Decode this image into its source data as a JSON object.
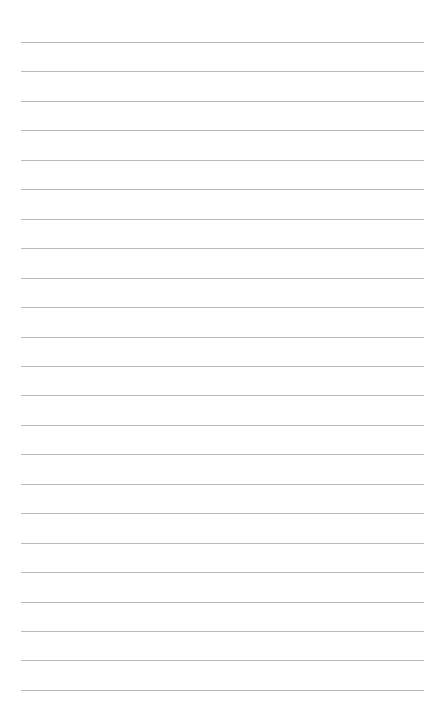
{
  "page": {
    "type": "lined-paper",
    "background_color": "#ffffff",
    "line_color": "#b8b8b8",
    "line_count": 23,
    "first_line_y": 42,
    "line_spacing": 29.45,
    "line_left": 21,
    "line_width": 403,
    "text": ""
  }
}
